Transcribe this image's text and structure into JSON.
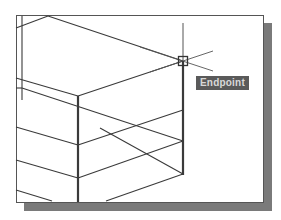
{
  "viewport": {
    "type": "CAD drawing area (isometric wireframe)",
    "background": "#ffffff",
    "line_color": "#3a3a3a",
    "shadow_color": "#7a7a7a"
  },
  "osnap": {
    "marker": "endpoint-square",
    "cursor_position": [
      183,
      61
    ],
    "tooltip_label": "Endpoint",
    "tooltip_bg": "#5a5a5a",
    "tooltip_fg": "#d8d8d8"
  }
}
